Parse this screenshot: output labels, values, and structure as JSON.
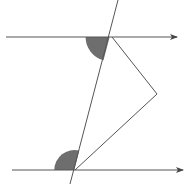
{
  "diagram": {
    "stroke_color": "#555555",
    "fill_color": "#6e6e6e",
    "background": "#ffffff",
    "parallel_lines": [
      {
        "name": "top-parallel-line",
        "x1": 6,
        "y1": 37,
        "x2": 177,
        "y2": 37
      },
      {
        "name": "bottom-parallel-line",
        "x1": 12,
        "y1": 170,
        "x2": 183,
        "y2": 170
      }
    ],
    "transversal": {
      "x1": 118,
      "y1": 0,
      "x2": 70,
      "y2": 184
    },
    "zigzag": [
      [
        112,
        37
      ],
      [
        157,
        94
      ],
      [
        75,
        170
      ]
    ],
    "shaded_angles": [
      {
        "name": "top-shaded-angle",
        "cx": 109.6,
        "cy": 37,
        "r": 24,
        "position": "below-left"
      },
      {
        "name": "bottom-shaded-angle",
        "cx": 74.3,
        "cy": 170,
        "r": 20,
        "position": "above-left"
      }
    ]
  }
}
